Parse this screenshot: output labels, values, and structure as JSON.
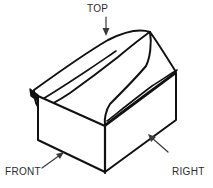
{
  "figure": {
    "title_alt": "Isometric line drawing of a house-shaped box with face callouts",
    "line_color": "#111111",
    "text_color": "#2b2b2b",
    "background_color": "#ffffff",
    "labels": {
      "top": "TOP",
      "front": "FRONT",
      "right_side_line1": "RIGHT",
      "right_side_line2": "SIDE"
    },
    "callouts": [
      {
        "name": "top",
        "label": "TOP",
        "direction": "down",
        "points_to": "roof-top-face"
      },
      {
        "name": "front",
        "label": "FRONT",
        "direction": "up-right",
        "points_to": "front-gable-face"
      },
      {
        "name": "right-side",
        "label": "RIGHT SIDE",
        "direction": "up-left",
        "points_to": "right-side-wall"
      }
    ],
    "faces": [
      {
        "name": "roof-top-face"
      },
      {
        "name": "roof-right-slope"
      },
      {
        "name": "front-gable-face"
      },
      {
        "name": "right-side-wall"
      }
    ]
  }
}
